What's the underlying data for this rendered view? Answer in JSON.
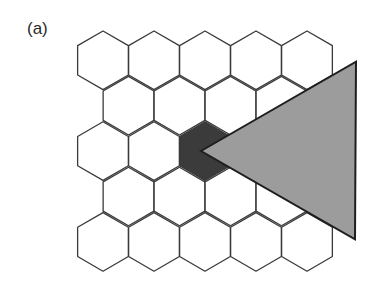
{
  "figure": {
    "panel_label": "(a)",
    "grid": {
      "type": "hexagonal",
      "orientation": "pointy-top",
      "radius": 29.3,
      "rows": [
        {
          "cy": 60.3,
          "cx": [
            103,
            154,
            205,
            256,
            307
          ]
        },
        {
          "cy": 105.7,
          "cx": [
            128.5,
            179.5,
            230.5,
            281.5
          ]
        },
        {
          "cy": 151.1,
          "cx": [
            103,
            154,
            205,
            256,
            307
          ]
        },
        {
          "cy": 196.5,
          "cx": [
            128.5,
            179.5,
            230.5,
            281.5
          ]
        },
        {
          "cy": 241.9,
          "cx": [
            103,
            154,
            205,
            256,
            307
          ]
        }
      ],
      "stroke": "#3a3a3a",
      "fill": "#ffffff"
    },
    "highlighted_cell": {
      "row": 2,
      "col": 2,
      "fill": "#3b3b3b"
    },
    "triangle": {
      "points": [
        [
          201,
          151
        ],
        [
          356,
          61.7
        ],
        [
          355,
          239.3
        ]
      ],
      "fill": "#9c9c9c",
      "stroke": "#1e1e1e"
    }
  }
}
